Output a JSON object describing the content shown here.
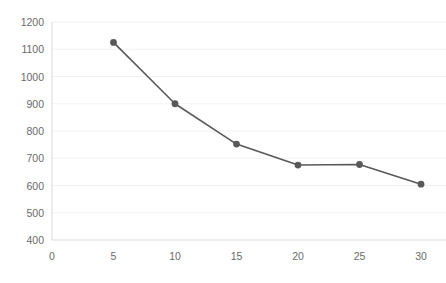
{
  "chart_data": {
    "type": "line",
    "title": "",
    "subtitle": "",
    "xlabel": "",
    "ylabel": "",
    "x": [
      5,
      10,
      15,
      20,
      25,
      30
    ],
    "values": [
      1125,
      900,
      752,
      675,
      677,
      605
    ],
    "series": [
      {
        "name": "",
        "x": [
          5,
          10,
          15,
          20,
          25,
          30
        ],
        "values": [
          1125,
          900,
          752,
          675,
          677,
          605
        ]
      }
    ],
    "xlim": [
      0,
      30
    ],
    "ylim": [
      400,
      1200
    ],
    "x_ticks": [
      0,
      5,
      10,
      15,
      20,
      25,
      30
    ],
    "y_ticks": [
      400,
      500,
      600,
      700,
      800,
      900,
      1000,
      1100,
      1200
    ],
    "x_tick_labels": [
      "0",
      "5",
      "10",
      "15",
      "20",
      "25",
      "30"
    ],
    "y_tick_labels": [
      "400",
      "500",
      "600",
      "700",
      "800",
      "900",
      "1000",
      "1100",
      "1200"
    ],
    "grid": {
      "horizontal": true,
      "vertical": false
    },
    "legend": {
      "visible": false,
      "position": "none",
      "entries": []
    },
    "annotations": [],
    "colors": {
      "line": "#595959",
      "marker": "#595959",
      "gridline": "#f2f2f2",
      "axis": "#d9d9d9",
      "tick_text": "#6a6a6a",
      "background": "#ffffff"
    },
    "style": {
      "line_width": 1.6,
      "marker_radius": 3.4,
      "marker_shape": "circle"
    }
  }
}
